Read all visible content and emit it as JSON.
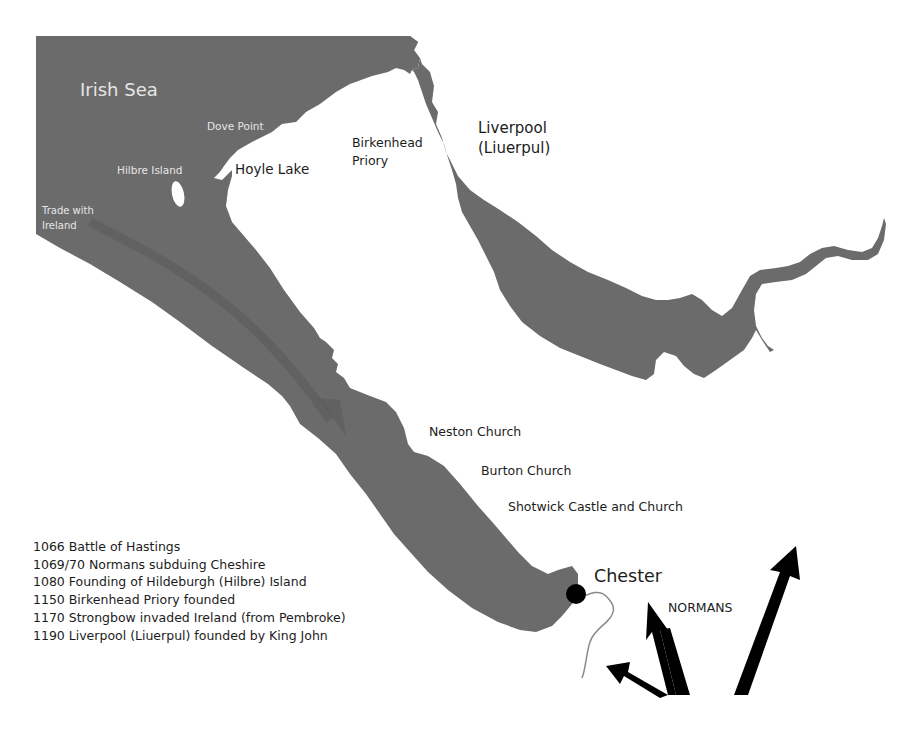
{
  "colors": {
    "water": "#6b6b6b",
    "land": "#ffffff",
    "text_dark": "#1c1c1c",
    "text_light": "#e6e6e6",
    "arrow": "#000000",
    "chester_outline": "#8a8a8a"
  },
  "labels": {
    "irish_sea": "Irish Sea",
    "dove_point": "Dove Point",
    "hilbre_island": "Hilbre Island",
    "hoyle_lake": "Hoyle Lake",
    "trade_with_ireland_line1": "Trade with",
    "trade_with_ireland_line2": "Ireland",
    "birkenhead_priory_line1": "Birkenhead",
    "birkenhead_priory_line2": "Priory",
    "liverpool_line1": "Liverpool",
    "liverpool_line2": "(Liuerpul)",
    "neston_church": "Neston Church",
    "burton_church": "Burton Church",
    "shotwick": "Shotwick Castle and Church",
    "chester": "Chester",
    "normans": "NORMANS"
  },
  "timeline": [
    "1066 Battle of Hastings",
    "1069/70 Normans subduing Cheshire",
    "1080 Founding of Hildeburgh (Hilbre) Island",
    "1150 Birkenhead Priory founded",
    "1170 Strongbow invaded Ireland (from Pembroke)",
    "1190 Liverpool (Liuerpul) founded by King John"
  ],
  "icons": {
    "chester_marker": "filled-circle",
    "trade_route": "curved-arrow",
    "norman_arrows": "bold-arrows"
  }
}
